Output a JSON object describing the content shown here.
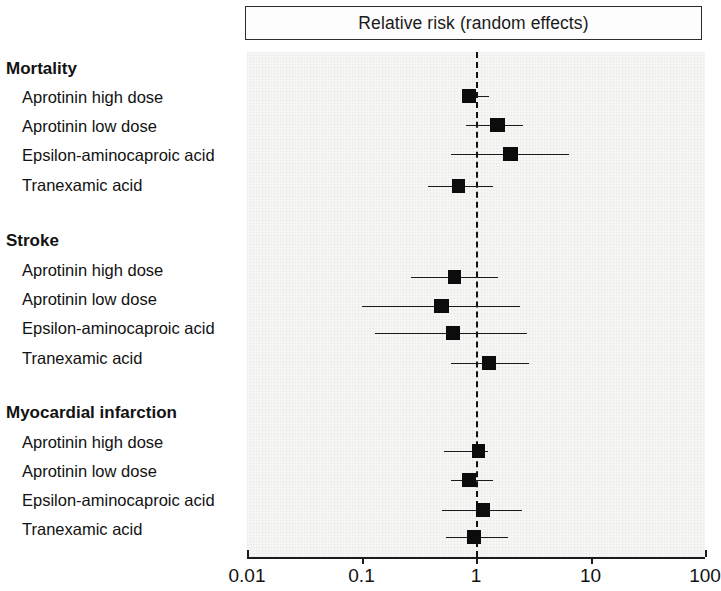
{
  "figure": {
    "title": "Relative risk (random effects)",
    "type": "forest-plot"
  },
  "axis": {
    "scale": "log10",
    "ticks": [
      "0.01",
      "0.1",
      "1",
      "10",
      "100"
    ],
    "tick_values": [
      0.01,
      0.1,
      1,
      10,
      100
    ],
    "reference_value": 1
  },
  "groups": [
    {
      "heading": "Mortality",
      "rows": [
        {
          "label": "Aprotinin high dose",
          "rr": 0.87,
          "lo": 0.75,
          "hi": 1.29,
          "weight": 3
        },
        {
          "label": "Aprotinin low dose",
          "rr": 1.55,
          "lo": 0.82,
          "hi": 2.58,
          "weight": 3
        },
        {
          "label": "Epsilon-aminocaproic acid",
          "rr": 2.0,
          "lo": 0.6,
          "hi": 6.5,
          "weight": 3
        },
        {
          "label": "Tranexamic acid",
          "rr": 0.7,
          "lo": 0.38,
          "hi": 1.4,
          "weight": 2
        }
      ]
    },
    {
      "heading": "Stroke",
      "rows": [
        {
          "label": "Aprotinin high dose",
          "rr": 0.65,
          "lo": 0.27,
          "hi": 1.55,
          "weight": 2
        },
        {
          "label": "Aprotinin low dose",
          "rr": 0.5,
          "lo": 0.1,
          "hi": 2.4,
          "weight": 3
        },
        {
          "label": "Epsilon-aminocaproic acid",
          "rr": 0.63,
          "lo": 0.13,
          "hi": 2.8,
          "weight": 3
        },
        {
          "label": "Tranexamic acid",
          "rr": 1.3,
          "lo": 0.6,
          "hi": 2.9,
          "weight": 3
        }
      ]
    },
    {
      "heading": "Myocardial infarction",
      "rows": [
        {
          "label": "Aprotinin high dose",
          "rr": 1.06,
          "lo": 0.53,
          "hi": 1.27,
          "weight": 2
        },
        {
          "label": "Aprotinin low dose",
          "rr": 0.87,
          "lo": 0.6,
          "hi": 1.4,
          "weight": 3
        },
        {
          "label": "Epsilon-aminocaproic acid",
          "rr": 1.15,
          "lo": 0.5,
          "hi": 2.5,
          "weight": 3
        },
        {
          "label": "Tranexamic acid",
          "rr": 0.96,
          "lo": 0.55,
          "hi": 1.9,
          "weight": 2
        }
      ]
    }
  ],
  "chart_data": {
    "type": "scatter",
    "subtype": "forest-plot",
    "title": "Relative risk (random effects)",
    "xlabel": "",
    "ylabel": "",
    "xscale": "log",
    "xlim": [
      0.01,
      100
    ],
    "xticks": [
      0.01,
      0.1,
      1,
      10,
      100
    ],
    "xtick_labels": [
      "0.01",
      "0.1",
      "1",
      "10",
      "100"
    ],
    "grid": false,
    "legend": "none",
    "reference_line": {
      "x": 1,
      "style": "dashed",
      "color": "#141414"
    },
    "categories": [
      "Mortality: Aprotinin high dose",
      "Mortality: Aprotinin low dose",
      "Mortality: Epsilon-aminocaproic acid",
      "Mortality: Tranexamic acid",
      "Stroke: Aprotinin high dose",
      "Stroke: Aprotinin low dose",
      "Stroke: Epsilon-aminocaproic acid",
      "Stroke: Tranexamic acid",
      "Myocardial infarction: Aprotinin high dose",
      "Myocardial infarction: Aprotinin low dose",
      "Myocardial infarction: Epsilon-aminocaproic acid",
      "Myocardial infarction: Tranexamic acid"
    ],
    "values": [
      0.87,
      1.55,
      2.0,
      0.7,
      0.65,
      0.5,
      0.63,
      1.3,
      1.06,
      0.87,
      1.15,
      0.96
    ],
    "ci_low": [
      0.75,
      0.82,
      0.6,
      0.38,
      0.27,
      0.1,
      0.13,
      0.6,
      0.53,
      0.6,
      0.5,
      0.55
    ],
    "ci_high": [
      1.29,
      2.58,
      6.5,
      1.4,
      1.55,
      2.4,
      2.8,
      2.9,
      1.27,
      1.4,
      2.5,
      1.9
    ]
  }
}
